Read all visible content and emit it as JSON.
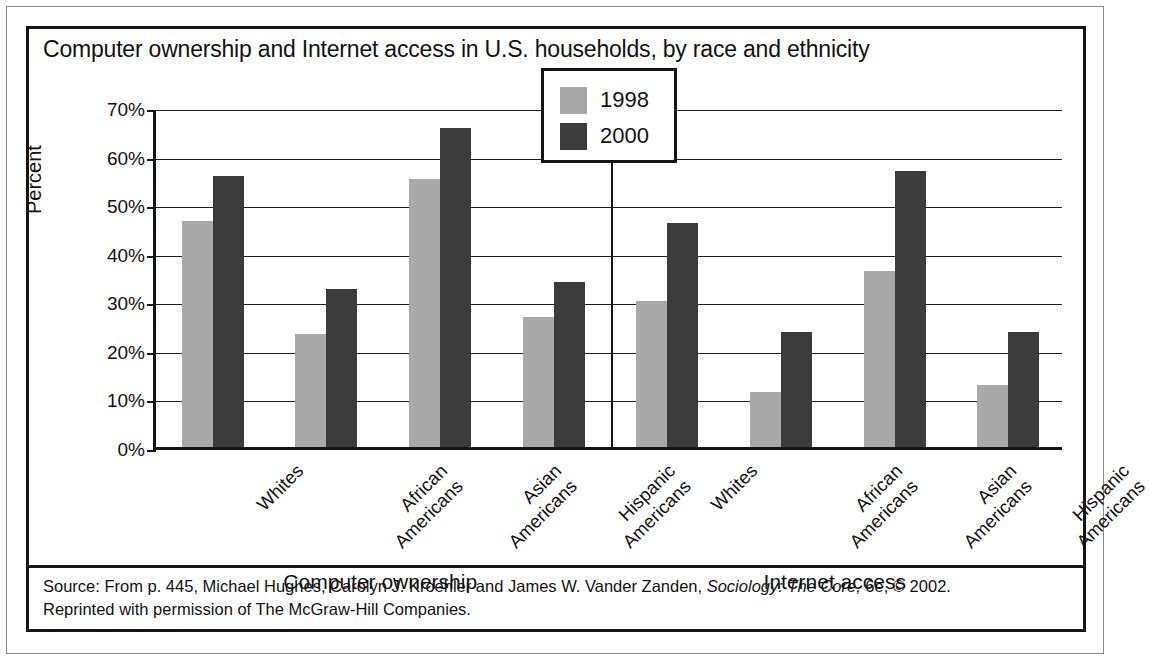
{
  "figure": {
    "title": "Computer ownership and Internet access in U.S. households, by race and ethnicity",
    "source_line1_a": "Source: From p. 445, Michael Hughes, Carolyn J. Kroehler and James W. Vander Zanden, ",
    "source_line1_italic": "Sociology: The Core,",
    "source_line1_b": " 6e, © 2002.",
    "source_line2": "Reprinted with permission of The McGraw-Hill Companies.",
    "colors": {
      "series_1998": "#a9a9a9",
      "series_2000": "#3b3b3b",
      "axis": "#151515",
      "grid": "#1b1b1b",
      "background": "#ffffff"
    }
  },
  "chart_data": {
    "type": "bar",
    "title": "Computer ownership and Internet access in U.S. households, by race and ethnicity",
    "xlabel": "",
    "ylabel": "Percent",
    "ylim": [
      0,
      70
    ],
    "ytick_labels": [
      "0%",
      "10%",
      "20%",
      "30%",
      "40%",
      "50%",
      "60%",
      "70%"
    ],
    "ytick_values": [
      0,
      10,
      20,
      30,
      40,
      50,
      60,
      70
    ],
    "grid": true,
    "legend_position": "upper center",
    "panels": [
      {
        "name": "Computer ownership",
        "categories": [
          "Whites",
          "African Americans",
          "Asian Americans",
          "Hispanic Americans"
        ],
        "series": [
          {
            "name": "1998",
            "values": [
              46.6,
              23.2,
              55.1,
              26.8
            ]
          },
          {
            "name": "2000",
            "values": [
              55.7,
              32.6,
              65.6,
              33.9
            ]
          }
        ]
      },
      {
        "name": "Internet access",
        "categories": [
          "Whites",
          "African Americans",
          "Asian Americans",
          "Hispanic Americans"
        ],
        "series": [
          {
            "name": "1998",
            "values": [
              30.0,
              11.4,
              36.3,
              12.8
            ]
          },
          {
            "name": "2000",
            "values": [
              46.1,
              23.6,
              56.8,
              23.6
            ]
          }
        ]
      }
    ],
    "legend": [
      {
        "label": "1998",
        "color": "#a9a9a9"
      },
      {
        "label": "2000",
        "color": "#3b3b3b"
      }
    ]
  }
}
